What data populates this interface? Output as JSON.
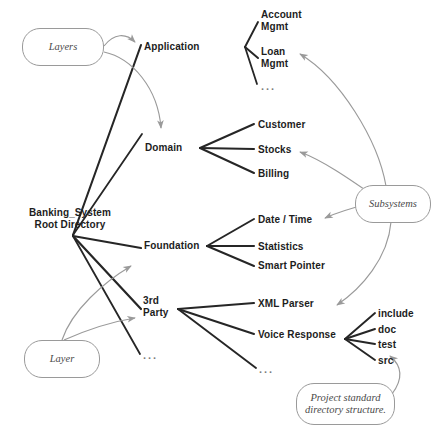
{
  "diagram": {
    "colors": {
      "edge_solid": "#262626",
      "edge_arrow_gray": "#9a9a9a",
      "note_border": "#9a9a9a",
      "note_text": "#4a4a4a",
      "label_text": "#1d1d1d",
      "ellipsis": "#7d7d7d",
      "background": "#ffffff"
    },
    "nodes": [
      {
        "id": "root",
        "label": "Banking_System\nRoot Directory",
        "x": 16,
        "y": 207,
        "align": "center",
        "width": 108
      },
      {
        "id": "application",
        "label": "Application",
        "x": 144,
        "y": 41,
        "align": "left"
      },
      {
        "id": "account",
        "label": "Account\nMgmt",
        "x": 261,
        "y": 9,
        "align": "left"
      },
      {
        "id": "loan",
        "label": "Loan\nMgmt",
        "x": 261,
        "y": 46,
        "align": "left"
      },
      {
        "id": "domain",
        "label": "Domain",
        "x": 145,
        "y": 142,
        "align": "left"
      },
      {
        "id": "customer",
        "label": "Customer",
        "x": 258,
        "y": 119,
        "align": "left"
      },
      {
        "id": "stocks",
        "label": "Stocks",
        "x": 258,
        "y": 144,
        "align": "left"
      },
      {
        "id": "billing",
        "label": "Billing",
        "x": 258,
        "y": 168,
        "align": "left"
      },
      {
        "id": "foundation",
        "label": "Foundation",
        "x": 144,
        "y": 240,
        "align": "left"
      },
      {
        "id": "datetime",
        "label": "Date / Time",
        "x": 258,
        "y": 214,
        "align": "left"
      },
      {
        "id": "statistics",
        "label": "Statistics",
        "x": 258,
        "y": 241,
        "align": "left"
      },
      {
        "id": "smartptr",
        "label": "Smart Pointer",
        "x": 258,
        "y": 260,
        "align": "left"
      },
      {
        "id": "thirdparty",
        "label": "3rd\nParty",
        "x": 143,
        "y": 295,
        "align": "left"
      },
      {
        "id": "xmlparser",
        "label": "XML Parser",
        "x": 258,
        "y": 298,
        "align": "left"
      },
      {
        "id": "voiceresp",
        "label": "Voice Response",
        "x": 258,
        "y": 329,
        "align": "left"
      },
      {
        "id": "include",
        "label": "include",
        "x": 378,
        "y": 308,
        "align": "left"
      },
      {
        "id": "doc",
        "label": "doc",
        "x": 378,
        "y": 324,
        "align": "left"
      },
      {
        "id": "test",
        "label": "test",
        "x": 378,
        "y": 339,
        "align": "left"
      },
      {
        "id": "src",
        "label": "src",
        "x": 378,
        "y": 355,
        "align": "left"
      }
    ],
    "ellipses": [
      {
        "id": "app-more",
        "label": "...",
        "x": 261,
        "y": 80
      },
      {
        "id": "root-more",
        "label": "...",
        "x": 143,
        "y": 349
      },
      {
        "id": "party-more",
        "label": "...",
        "x": 259,
        "y": 363
      }
    ],
    "notes": [
      {
        "id": "layers",
        "label": "Layers",
        "x": 22,
        "y": 28,
        "w": 82,
        "h": 38
      },
      {
        "id": "layer",
        "label": "Layer",
        "x": 24,
        "y": 340,
        "w": 76,
        "h": 38
      },
      {
        "id": "subsystems",
        "label": "Subsystems",
        "x": 355,
        "y": 185,
        "w": 76,
        "h": 38
      },
      {
        "id": "projectstd",
        "label": "Project standard\ndirectory structure.",
        "x": 296,
        "y": 383,
        "w": 99,
        "h": 42
      }
    ],
    "edges": [
      {
        "from": "root",
        "to": "application",
        "style": "solid"
      },
      {
        "from": "root",
        "to": "domain",
        "style": "solid"
      },
      {
        "from": "root",
        "to": "foundation",
        "style": "solid"
      },
      {
        "from": "root",
        "to": "thirdparty",
        "style": "solid"
      },
      {
        "from": "root",
        "to": "root-more",
        "style": "solid"
      },
      {
        "from": "application",
        "to": "account",
        "style": "solid"
      },
      {
        "from": "application",
        "to": "loan",
        "style": "solid"
      },
      {
        "from": "application",
        "to": "app-more",
        "style": "solid"
      },
      {
        "from": "domain",
        "to": "customer",
        "style": "solid"
      },
      {
        "from": "domain",
        "to": "stocks",
        "style": "solid"
      },
      {
        "from": "domain",
        "to": "billing",
        "style": "solid"
      },
      {
        "from": "foundation",
        "to": "datetime",
        "style": "solid"
      },
      {
        "from": "foundation",
        "to": "statistics",
        "style": "solid"
      },
      {
        "from": "foundation",
        "to": "smartptr",
        "style": "solid"
      },
      {
        "from": "thirdparty",
        "to": "xmlparser",
        "style": "solid"
      },
      {
        "from": "thirdparty",
        "to": "voiceresp",
        "style": "solid"
      },
      {
        "from": "thirdparty",
        "to": "party-more",
        "style": "solid"
      },
      {
        "from": "voiceresp",
        "to": "include",
        "style": "solid"
      },
      {
        "from": "voiceresp",
        "to": "doc",
        "style": "solid"
      },
      {
        "from": "voiceresp",
        "to": "test",
        "style": "solid"
      },
      {
        "from": "voiceresp",
        "to": "src",
        "style": "solid"
      },
      {
        "from": "layers",
        "to": "application",
        "style": "gray-arrow"
      },
      {
        "from": "layers",
        "to": "domain",
        "style": "gray-arrow"
      },
      {
        "from": "layer",
        "to": "foundation",
        "style": "gray-arrow"
      },
      {
        "from": "layer",
        "to": "thirdparty",
        "style": "gray-arrow"
      },
      {
        "from": "subsystems",
        "to": "loan",
        "style": "gray-arrow"
      },
      {
        "from": "subsystems",
        "to": "stocks",
        "style": "gray-arrow"
      },
      {
        "from": "subsystems",
        "to": "datetime",
        "style": "gray-arrow"
      },
      {
        "from": "subsystems",
        "to": "xmlparser",
        "style": "gray-arrow"
      },
      {
        "from": "projectstd",
        "to": "src",
        "style": "gray-arrow"
      }
    ]
  }
}
